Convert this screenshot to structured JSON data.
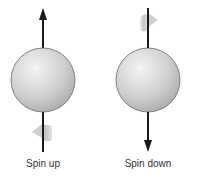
{
  "diagram": {
    "left": {
      "label": "Spin up",
      "direction": "up"
    },
    "right": {
      "label": "Spin down",
      "direction": "down"
    }
  },
  "colors": {
    "sphere_light": "#f0f0f0",
    "sphere_dark": "#a8a8a8",
    "arrow": "#1a1a1a",
    "curl": "#c8c8c8"
  }
}
